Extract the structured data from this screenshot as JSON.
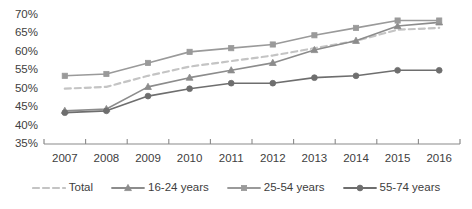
{
  "chart_data": {
    "type": "line",
    "title": "",
    "subtitle": "",
    "xlabel": "",
    "ylabel": "",
    "categories": [
      "2007",
      "2008",
      "2009",
      "2010",
      "2011",
      "2012",
      "2013",
      "2014",
      "2015",
      "2016"
    ],
    "ylim": [
      35,
      70
    ],
    "yticks": [
      35,
      40,
      45,
      50,
      55,
      60,
      65,
      70
    ],
    "ytick_labels": [
      "35%",
      "40%",
      "45%",
      "50%",
      "55%",
      "60%",
      "65%",
      "70%"
    ],
    "grid": false,
    "legend_position": "bottom",
    "value_suffix": "%",
    "series": [
      {
        "name": "Total",
        "color": "#c4c4c4",
        "marker": "none",
        "dash": "dashed",
        "values": [
          50.0,
          50.5,
          53.5,
          56.0,
          57.5,
          59.0,
          61.0,
          63.0,
          66.0,
          66.5
        ]
      },
      {
        "name": "16-24 years",
        "color": "#8c8c8c",
        "marker": "triangle",
        "dash": "solid",
        "values": [
          44.0,
          44.5,
          50.5,
          53.0,
          55.0,
          57.0,
          60.5,
          63.0,
          67.0,
          68.0
        ]
      },
      {
        "name": "25-54 years",
        "color": "#9a9a9a",
        "marker": "square",
        "dash": "solid",
        "values": [
          53.5,
          54.0,
          57.0,
          60.0,
          61.0,
          62.0,
          64.5,
          66.5,
          68.5,
          68.5
        ]
      },
      {
        "name": "55-74 years",
        "color": "#6e6e6e",
        "marker": "circle",
        "dash": "solid",
        "values": [
          43.5,
          44.0,
          48.0,
          50.0,
          51.5,
          51.5,
          53.0,
          53.5,
          55.0,
          55.0
        ]
      }
    ]
  },
  "legend": {
    "items": [
      {
        "label": "Total"
      },
      {
        "label": "16-24 years"
      },
      {
        "label": "25-54 years"
      },
      {
        "label": "55-74 years"
      }
    ]
  },
  "axis": {
    "axis_color": "#8a8a8a"
  }
}
